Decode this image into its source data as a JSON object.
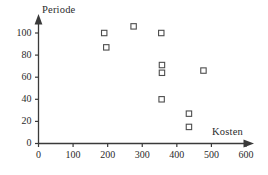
{
  "chart_data": {
    "type": "scatter",
    "title": "",
    "subtitle": "",
    "xlabel": "Kosten",
    "ylabel": "Periode",
    "xlim": [
      0,
      600
    ],
    "ylim": [
      0,
      110
    ],
    "xticks": [
      0,
      100,
      200,
      300,
      400,
      500,
      600
    ],
    "yticks": [
      0,
      20,
      40,
      60,
      80,
      100
    ],
    "xtick_labels": [
      "0",
      "100",
      "200",
      "300",
      "400",
      "500",
      "600"
    ],
    "ytick_labels": [
      "0",
      "20",
      "40",
      "60",
      "80",
      "100"
    ],
    "grid": false,
    "legend": false,
    "legend_position": "none",
    "marker": "open-square",
    "marker_color": "#4d4d4d",
    "axis_color": "#3a3a3a",
    "background_color": "#ffffff",
    "annotations": [],
    "points": [
      {
        "x": 190,
        "y": 100
      },
      {
        "x": 196,
        "y": 87
      },
      {
        "x": 275,
        "y": 106
      },
      {
        "x": 355,
        "y": 100
      },
      {
        "x": 357,
        "y": 71
      },
      {
        "x": 357,
        "y": 64
      },
      {
        "x": 356,
        "y": 40
      },
      {
        "x": 435,
        "y": 27
      },
      {
        "x": 435,
        "y": 15
      },
      {
        "x": 477,
        "y": 66
      }
    ]
  },
  "axes": {
    "y_title": "Periode",
    "x_title": "Kosten"
  }
}
